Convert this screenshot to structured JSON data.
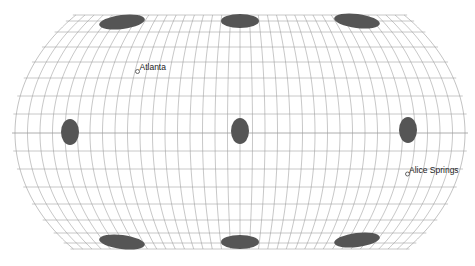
{
  "map": {
    "width": 475,
    "height": 266,
    "center_x": 240,
    "equator_y": 133,
    "half_width_equator": 225,
    "half_height": 117,
    "boundary_k": 0.46,
    "meridian_step_deg": 10,
    "parallel_ys": [
      15,
      21,
      32,
      47,
      62,
      78,
      96,
      114,
      133,
      151,
      169,
      187,
      204,
      220,
      233,
      243,
      249
    ],
    "colors": {
      "background": "#ffffff",
      "graticule": "#9a9a9a",
      "ellipse": "#555555",
      "marker_stroke": "#444444",
      "label": "#222222"
    }
  },
  "indicatrices": [
    {
      "cx": 122,
      "cy": 22,
      "rx": 23,
      "ry": 7,
      "rotate": -7
    },
    {
      "cx": 240,
      "cy": 21,
      "rx": 19,
      "ry": 7,
      "rotate": 0
    },
    {
      "cx": 357,
      "cy": 21,
      "rx": 23,
      "ry": 7,
      "rotate": 7
    },
    {
      "cx": 70,
      "cy": 132,
      "rx": 9,
      "ry": 13,
      "rotate": 0
    },
    {
      "cx": 240,
      "cy": 131,
      "rx": 9,
      "ry": 13,
      "rotate": 0
    },
    {
      "cx": 408,
      "cy": 130,
      "rx": 9,
      "ry": 13,
      "rotate": 0
    },
    {
      "cx": 122,
      "cy": 242,
      "rx": 23,
      "ry": 7,
      "rotate": 7
    },
    {
      "cx": 240,
      "cy": 242,
      "rx": 19,
      "ry": 7,
      "rotate": 0
    },
    {
      "cx": 357,
      "cy": 240,
      "rx": 23,
      "ry": 7,
      "rotate": -7
    }
  ],
  "cities": [
    {
      "name": "Atlanta",
      "x": 137.5,
      "y": 71.5,
      "label_x": 139.5,
      "label_y": 70
    },
    {
      "name": "Alice Springs",
      "x": 407.5,
      "y": 174,
      "label_x": 409,
      "label_y": 172.5
    }
  ]
}
